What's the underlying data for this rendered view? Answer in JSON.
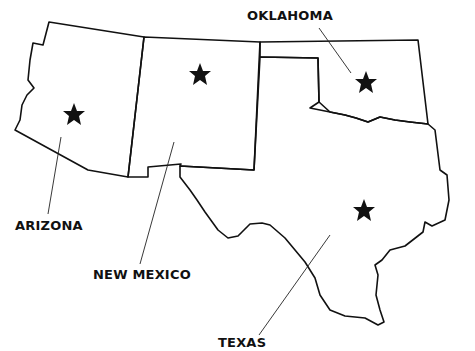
{
  "map": {
    "line_color": "#111111",
    "background": "#ffffff",
    "states": [
      {
        "name": "ARIZONA",
        "label_x": 15,
        "label_y": 219,
        "star": [
          74,
          115
        ],
        "leader": [
          [
            61,
            137
          ],
          [
            48,
            214
          ]
        ]
      },
      {
        "name": "NEW MEXICO",
        "label_x": 93,
        "label_y": 268,
        "star": [
          200,
          75
        ],
        "leader": [
          [
            174,
            142
          ],
          [
            140,
            264
          ]
        ]
      },
      {
        "name": "OKLAHOMA",
        "label_x": 247,
        "label_y": 9,
        "star": [
          366,
          83
        ],
        "leader": [
          [
            319,
            28
          ],
          [
            351,
            73
          ]
        ]
      },
      {
        "name": "TEXAS",
        "label_x": 218,
        "label_y": 336,
        "star": [
          364,
          211
        ],
        "leader": [
          [
            330,
            235
          ],
          [
            259,
            335
          ]
        ]
      }
    ]
  }
}
